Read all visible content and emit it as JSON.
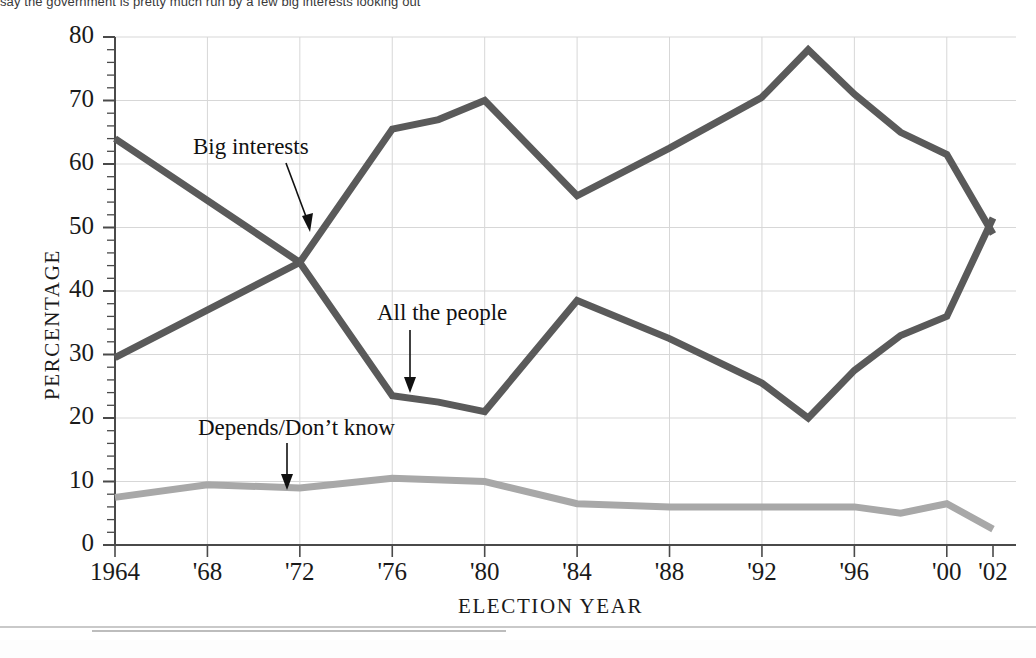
{
  "page": {
    "top_caption_visible_text": "say the government is pretty much run by a few big interests looking out",
    "width": 1036,
    "height": 658
  },
  "axes": {
    "y_title": "PERCENTAGE",
    "x_title": "ELECTION YEAR",
    "y_ticks": [
      "0",
      "10",
      "20",
      "30",
      "40",
      "50",
      "60",
      "70",
      "80"
    ],
    "x_ticks": [
      "1964",
      "'68",
      "'72",
      "'76",
      "'80",
      "'84",
      "'88",
      "'92",
      "'96",
      "'00",
      "'02"
    ]
  },
  "annotations": [
    {
      "name": "big-interests",
      "text": "Big interests"
    },
    {
      "name": "all-the-people",
      "text": "All the people"
    },
    {
      "name": "depends-dont-know",
      "text": "Depends/Don’t know"
    }
  ],
  "colors": {
    "dark_line": "#5a5a5a",
    "light_line": "#a8a8a8",
    "grid": "#d7d7d7",
    "axis": "#4a4a4a",
    "text": "#1a1a1a"
  },
  "chart_data": {
    "type": "line",
    "title": "",
    "xlabel": "ELECTION YEAR",
    "ylabel": "PERCENTAGE",
    "xlim": [
      1964,
      2002
    ],
    "ylim": [
      0,
      80
    ],
    "y_tick_step": 10,
    "y_minor_tick_step": 2,
    "grid": true,
    "grid_axis": "both",
    "legend": "inline-annotations",
    "x": [
      1964,
      1968,
      1972,
      1976,
      1978,
      1980,
      1984,
      1988,
      1992,
      1994,
      1996,
      1998,
      2000,
      2002
    ],
    "series": [
      {
        "name": "Big interests",
        "color": "#5a5a5a",
        "x": [
          1964,
          1972,
          1976,
          1978,
          1980,
          1984,
          1988,
          1992,
          1994,
          1996,
          1998,
          2000,
          2002
        ],
        "values": [
          64,
          44.5,
          65.5,
          67,
          70,
          55,
          62.5,
          70.5,
          78,
          71,
          65,
          61.5,
          49
        ]
      },
      {
        "name": "All the people",
        "color": "#5a5a5a",
        "x": [
          1964,
          1972,
          1976,
          1978,
          1980,
          1984,
          1988,
          1992,
          1994,
          1996,
          1998,
          2000,
          2002
        ],
        "values": [
          29.5,
          44.5,
          23.5,
          22.5,
          21,
          38.5,
          32.5,
          25.5,
          20,
          27.5,
          33,
          36,
          51.5
        ]
      },
      {
        "name": "Depends/Don’t know",
        "color": "#a8a8a8",
        "x": [
          1964,
          1968,
          1972,
          1976,
          1980,
          1984,
          1988,
          1992,
          1996,
          1998,
          2000,
          2002
        ],
        "values": [
          7.5,
          9.5,
          9,
          10.5,
          10,
          6.5,
          6,
          6,
          6,
          5,
          6.5,
          2.5
        ]
      }
    ]
  }
}
